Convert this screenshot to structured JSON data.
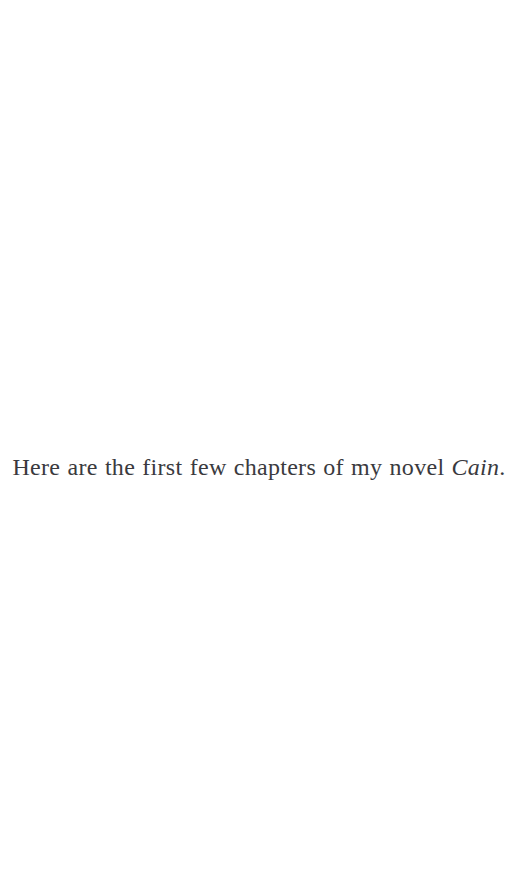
{
  "page": {
    "background_color": "#ffffff",
    "text_color": "#3a3a3e",
    "width": 518,
    "height": 869
  },
  "content": {
    "paragraph": {
      "lead_text": "Here are the first few chapters of my novel ",
      "work_title": "Cain",
      "terminal_punctuation": ".",
      "full_text": "Here are the first few chapters of my novel Cain."
    }
  }
}
